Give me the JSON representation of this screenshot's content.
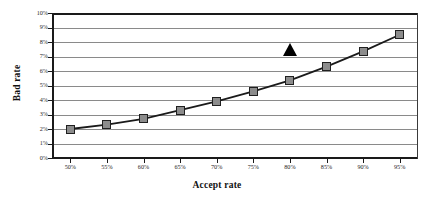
{
  "chart_data": {
    "type": "line",
    "title": "",
    "xlabel": "Accept rate",
    "ylabel": "Bad rate",
    "x": [
      50,
      55,
      60,
      65,
      70,
      75,
      80,
      85,
      90,
      95
    ],
    "categories": [
      "50%",
      "55%",
      "60%",
      "65%",
      "70%",
      "75%",
      "80%",
      "85%",
      "90%",
      "95%"
    ],
    "values": [
      2.0,
      2.3,
      2.7,
      3.3,
      3.9,
      4.6,
      5.35,
      6.3,
      7.35,
      8.5
    ],
    "series": [
      {
        "name": "Bad rate",
        "values": [
          2.0,
          2.3,
          2.7,
          3.3,
          3.9,
          4.6,
          5.35,
          6.3,
          7.35,
          8.5
        ],
        "marker": "square",
        "marker_color": "#8c8c8c",
        "marker_edge_color": "#202020",
        "line_color": "#1a1a1a"
      }
    ],
    "annotations": [
      {
        "name": "triangle-marker",
        "shape": "triangle",
        "x": 80,
        "y": 7.05,
        "color": "#000000"
      }
    ],
    "xlim": [
      47.5,
      97.5
    ],
    "ylim": [
      0,
      10
    ],
    "ytick_values": [
      0,
      1,
      2,
      3,
      4,
      5,
      6,
      7,
      8,
      9,
      10
    ],
    "yticks": [
      "0%",
      "1%",
      "2%",
      "3%",
      "4%",
      "5%",
      "6%",
      "7%",
      "8%",
      "9%",
      "10%"
    ],
    "xticks": [
      "50%",
      "55%",
      "60%",
      "65%",
      "70%",
      "75%",
      "80%",
      "85%",
      "90%",
      "95%"
    ],
    "grid": true,
    "grid_axis": "y",
    "grid_color": "#8a8a8a",
    "legend": false,
    "legend_position": "none",
    "plot_background": "#ffffff",
    "axis_color": "#1a1a1a"
  }
}
